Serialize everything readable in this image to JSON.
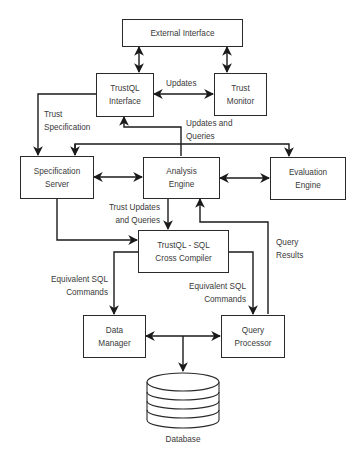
{
  "diagram": {
    "type": "architecture-block-diagram",
    "nodes": {
      "external_interface": {
        "label": "External Interface"
      },
      "trustql_interface": {
        "line1": "TrustQL",
        "line2": "Interface"
      },
      "trust_monitor": {
        "line1": "Trust",
        "line2": "Monitor"
      },
      "specification_server": {
        "line1": "Specification",
        "line2": "Server"
      },
      "analysis_engine": {
        "line1": "Analysis",
        "line2": "Engine"
      },
      "evaluation_engine": {
        "line1": "Evaluation",
        "line2": "Engine"
      },
      "cross_compiler": {
        "line1": "TrustQL - SQL",
        "line2": "Cross Compiler"
      },
      "data_manager": {
        "line1": "Data",
        "line2": "Manager"
      },
      "query_processor": {
        "line1": "Query",
        "line2": "Processor"
      },
      "database": {
        "label": "Database"
      }
    },
    "edge_labels": {
      "updates": "Updates",
      "trust_specification": {
        "line1": "Trust",
        "line2": "Specification"
      },
      "updates_and_queries": {
        "line1": "Updates and",
        "line2": "Queries"
      },
      "trust_updates_and_queries": {
        "line1": "Trust Updates",
        "line2": "and Queries"
      },
      "query_results": {
        "line1": "Query",
        "line2": "Results"
      },
      "equivalent_sql_left": {
        "line1": "Equivalent SQL",
        "line2": "Commands"
      },
      "equivalent_sql_right": {
        "line1": "Equivalent SQL",
        "line2": "Commands"
      }
    },
    "edges": [
      {
        "from": "External Interface",
        "to": "TrustQL Interface",
        "direction": "both"
      },
      {
        "from": "External Interface",
        "to": "Trust Monitor",
        "direction": "both"
      },
      {
        "from": "TrustQL Interface",
        "to": "Trust Monitor",
        "direction": "both",
        "label": "Updates"
      },
      {
        "from": "TrustQL Interface",
        "to": "Specification Server",
        "direction": "forward",
        "label": "Trust Specification"
      },
      {
        "from": "Analysis Engine",
        "to": "TrustQL Interface",
        "direction": "forward",
        "label": "Updates and Queries"
      },
      {
        "from": "Analysis Engine",
        "to": "Specification Server",
        "direction": "forward"
      },
      {
        "from": "Analysis Engine",
        "to": "Evaluation Engine",
        "direction": "forward"
      },
      {
        "from": "TrustQL Interface",
        "to": "Analysis Engine",
        "direction": "forward"
      },
      {
        "from": "Specification Server",
        "to": "Analysis Engine",
        "direction": "both"
      },
      {
        "from": "Analysis Engine",
        "to": "Evaluation Engine",
        "direction": "both"
      },
      {
        "from": "Analysis Engine",
        "to": "TrustQL - SQL Cross Compiler",
        "direction": "forward",
        "label": "Trust Updates and Queries"
      },
      {
        "from": "Specification Server",
        "to": "TrustQL - SQL Cross Compiler",
        "direction": "forward"
      },
      {
        "from": "TrustQL - SQL Cross Compiler",
        "to": "Data Manager",
        "direction": "forward",
        "label": "Equivalent SQL Commands"
      },
      {
        "from": "TrustQL - SQL Cross Compiler",
        "to": "Query Processor",
        "direction": "forward",
        "label": "Equivalent SQL Commands"
      },
      {
        "from": "Query Processor",
        "to": "Analysis Engine",
        "direction": "forward",
        "label": "Query Results"
      },
      {
        "from": "Data Manager",
        "to": "Query Processor",
        "direction": "both"
      },
      {
        "from": "Data Manager / Query Processor",
        "to": "Database",
        "direction": "forward"
      }
    ],
    "colors": {
      "line": "#1a1a1a",
      "box_border": "#2a2a2a",
      "text": "#3a3a3a",
      "background": "#ffffff"
    }
  }
}
